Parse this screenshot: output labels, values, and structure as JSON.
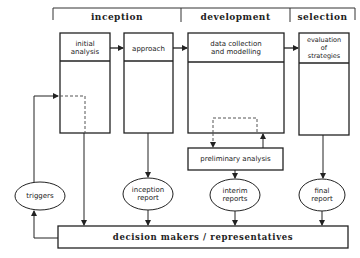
{
  "phases": [
    {
      "label": "inception"
    },
    {
      "label": "development"
    },
    {
      "label": "selection"
    }
  ],
  "boxes": {
    "initial_analysis": "initial\nanalysis",
    "approach": "approach",
    "data_collection": "data collection\nand modelling",
    "evaluation": "evaluation\nof\nstrategies",
    "preliminary_analysis": "preliminary analysis"
  },
  "ellipses": {
    "triggers": "triggers",
    "inception_report": "inception\nreport",
    "interim_reports": "interim\nreports",
    "final_report": "final\nreport"
  },
  "decision_makers": "decision makers / representatives",
  "colors": {
    "line": "#222222",
    "dashed": "#555555",
    "background": "#ffffff"
  }
}
